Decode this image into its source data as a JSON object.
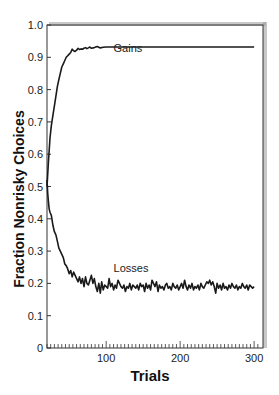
{
  "chart_data": {
    "type": "line",
    "title": "",
    "xlabel": "Trials",
    "ylabel": "Fraction Nonrisky Choices",
    "xlim": [
      20,
      312
    ],
    "ylim": [
      0,
      1.0
    ],
    "xticks": [
      100,
      200,
      300
    ],
    "xtick_labels": [
      "100",
      "200",
      "300"
    ],
    "x_minor_tick_step": 5,
    "yticks": [
      0,
      0.1,
      0.2,
      0.3,
      0.4,
      0.5,
      0.6,
      0.7,
      0.8,
      0.9,
      1.0
    ],
    "ytick_labels": [
      "0",
      "0.1",
      "0.2",
      "0.3",
      "0.4",
      "0.5",
      "0.6",
      "0.7",
      "0.8",
      "0.9",
      "1.0"
    ],
    "grid": false,
    "legend": "inline labels",
    "series": [
      {
        "name": "Gains",
        "label_pos": [
          110,
          0.915
        ],
        "x": [
          20,
          22,
          24,
          26,
          28,
          30,
          32,
          34,
          36,
          38,
          40,
          42,
          44,
          46,
          48,
          50,
          52,
          54,
          56,
          58,
          60,
          62,
          64,
          66,
          68,
          70,
          72,
          74,
          76,
          78,
          80,
          84,
          88,
          92,
          96,
          100,
          105,
          110,
          115,
          120,
          130,
          140,
          150,
          160,
          170,
          180,
          190,
          200,
          210,
          220,
          230,
          240,
          250,
          260,
          270,
          280,
          290,
          300
        ],
        "values": [
          0.5,
          0.58,
          0.65,
          0.69,
          0.72,
          0.75,
          0.78,
          0.81,
          0.83,
          0.85,
          0.87,
          0.88,
          0.89,
          0.9,
          0.905,
          0.91,
          0.915,
          0.925,
          0.92,
          0.918,
          0.922,
          0.928,
          0.924,
          0.926,
          0.925,
          0.928,
          0.93,
          0.927,
          0.929,
          0.932,
          0.928,
          0.93,
          0.933,
          0.929,
          0.931,
          0.932,
          0.932,
          0.932,
          0.932,
          0.932,
          0.932,
          0.932,
          0.932,
          0.932,
          0.932,
          0.932,
          0.932,
          0.932,
          0.932,
          0.932,
          0.932,
          0.932,
          0.932,
          0.932,
          0.932,
          0.932,
          0.932,
          0.932
        ]
      },
      {
        "name": "Losses",
        "label_pos": [
          110,
          0.235
        ],
        "x": [
          20,
          21,
          22,
          23,
          24,
          26,
          28,
          30,
          32,
          34,
          36,
          38,
          40,
          42,
          44,
          46,
          48,
          50,
          52,
          54,
          56,
          58,
          60,
          62,
          64,
          66,
          68,
          70,
          72,
          74,
          76,
          78,
          80,
          82,
          84,
          86,
          88,
          90,
          92,
          94,
          96,
          98,
          100,
          102,
          104,
          106,
          108,
          110,
          112,
          114,
          116,
          118,
          120,
          122,
          124,
          126,
          128,
          130,
          132,
          134,
          136,
          138,
          140,
          142,
          144,
          146,
          148,
          150,
          152,
          154,
          156,
          158,
          160,
          162,
          164,
          166,
          168,
          170,
          172,
          174,
          176,
          178,
          180,
          182,
          184,
          186,
          188,
          190,
          192,
          194,
          196,
          198,
          200,
          202,
          204,
          206,
          208,
          210,
          212,
          214,
          216,
          218,
          220,
          222,
          224,
          226,
          228,
          230,
          232,
          234,
          236,
          238,
          240,
          242,
          244,
          246,
          248,
          250,
          252,
          254,
          256,
          258,
          260,
          262,
          264,
          266,
          268,
          270,
          272,
          274,
          276,
          278,
          280,
          282,
          284,
          286,
          288,
          290,
          292,
          294,
          296,
          298,
          300
        ],
        "values": [
          0.52,
          0.48,
          0.45,
          0.43,
          0.42,
          0.41,
          0.38,
          0.36,
          0.35,
          0.33,
          0.31,
          0.3,
          0.29,
          0.28,
          0.26,
          0.255,
          0.245,
          0.23,
          0.24,
          0.22,
          0.235,
          0.225,
          0.215,
          0.205,
          0.22,
          0.2,
          0.215,
          0.19,
          0.22,
          0.2,
          0.195,
          0.21,
          0.225,
          0.2,
          0.215,
          0.19,
          0.175,
          0.2,
          0.17,
          0.205,
          0.18,
          0.195,
          0.19,
          0.185,
          0.215,
          0.19,
          0.2,
          0.18,
          0.195,
          0.185,
          0.21,
          0.2,
          0.19,
          0.185,
          0.195,
          0.175,
          0.19,
          0.185,
          0.2,
          0.18,
          0.195,
          0.19,
          0.185,
          0.195,
          0.18,
          0.2,
          0.19,
          0.195,
          0.175,
          0.2,
          0.185,
          0.195,
          0.18,
          0.21,
          0.2,
          0.19,
          0.205,
          0.175,
          0.195,
          0.185,
          0.19,
          0.18,
          0.195,
          0.2,
          0.185,
          0.19,
          0.18,
          0.2,
          0.19,
          0.185,
          0.195,
          0.18,
          0.19,
          0.2,
          0.185,
          0.21,
          0.19,
          0.18,
          0.195,
          0.185,
          0.2,
          0.18,
          0.19,
          0.185,
          0.195,
          0.18,
          0.2,
          0.19,
          0.185,
          0.195,
          0.205,
          0.2,
          0.21,
          0.195,
          0.205,
          0.19,
          0.17,
          0.2,
          0.185,
          0.195,
          0.18,
          0.2,
          0.185,
          0.19,
          0.18,
          0.195,
          0.185,
          0.2,
          0.19,
          0.185,
          0.195,
          0.18,
          0.19,
          0.185,
          0.2,
          0.19,
          0.185,
          0.195,
          0.18,
          0.195,
          0.19,
          0.185,
          0.19
        ]
      }
    ]
  },
  "colors": {
    "line": "#1a1a1a",
    "axis": "#333333",
    "shadow": "#9a9a9a",
    "background": "#ffffff"
  }
}
